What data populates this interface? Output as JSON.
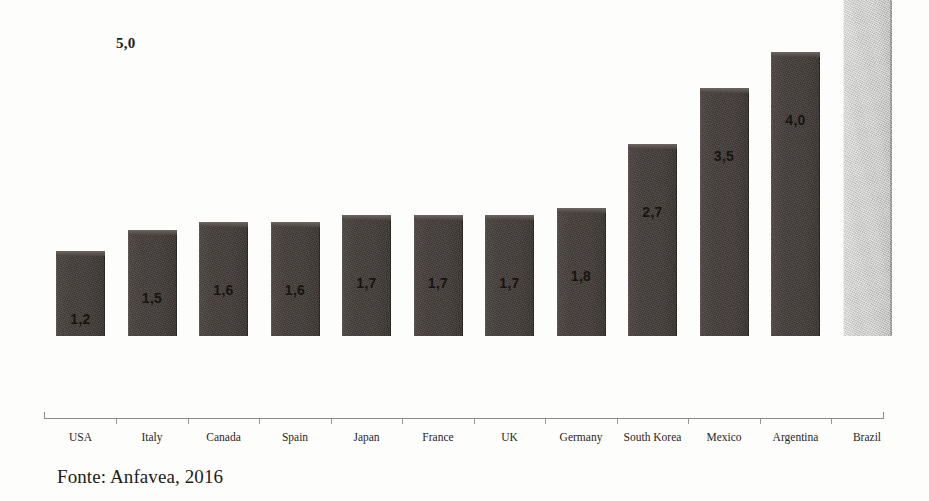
{
  "chart_data": {
    "type": "bar",
    "title": "",
    "xlabel": "",
    "ylabel": "",
    "categories": [
      "USA",
      "Italy",
      "Canada",
      "Spain",
      "Japan",
      "France",
      "UK",
      "Germany",
      "South Korea",
      "Mexico",
      "Argentina",
      "Brazil"
    ],
    "values": [
      1.2,
      1.5,
      1.6,
      1.6,
      1.7,
      1.7,
      1.7,
      1.8,
      2.7,
      3.5,
      4.0,
      5.0
    ],
    "value_labels": [
      "1,2",
      "1,5",
      "1,6",
      "1,6",
      "1,7",
      "1,7",
      "1,7",
      "1,8",
      "2,7",
      "3,5",
      "4,0",
      ""
    ],
    "ylim": [
      0,
      5.0
    ],
    "axis_max_label": "5,0",
    "grid": false,
    "legend": null,
    "decimal_separator": ",",
    "highlight_category": "Brazil",
    "highlight_note": "Brazil bar rendered in light gray; its value label is not drawn above the bar",
    "colors": {
      "bar": "#463f3c",
      "bar_highlight": "#c6c7c4",
      "axis": "#8e8c88",
      "text": "#1d1b19",
      "background": "#fdfdfc"
    }
  },
  "source": {
    "caption": "Fonte: Anfavea, 2016"
  }
}
